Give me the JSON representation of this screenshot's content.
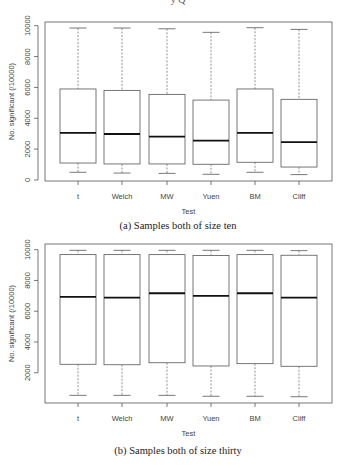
{
  "figure": {
    "top_cut_text": "y Q"
  },
  "chart_data": [
    {
      "type": "box",
      "title": "",
      "caption": "(a) Samples both of size ten",
      "xlabel": "Test",
      "ylabel": "No. significant (/10000)",
      "ylim": [
        0,
        10000
      ],
      "yticks": [
        0,
        2000,
        4000,
        6000,
        8000,
        10000
      ],
      "grid": false,
      "categories": [
        "t",
        "Welch",
        "MW",
        "Yuen",
        "BM",
        "Cliff"
      ],
      "series": [
        {
          "name": "t",
          "whisker_low": 500,
          "q1": 1100,
          "median": 3050,
          "q3": 5900,
          "whisker_high": 9850
        },
        {
          "name": "Welch",
          "whisker_low": 450,
          "q1": 1040,
          "median": 2980,
          "q3": 5810,
          "whisker_high": 9850
        },
        {
          "name": "MW",
          "whisker_low": 430,
          "q1": 1040,
          "median": 2810,
          "q3": 5550,
          "whisker_high": 9800
        },
        {
          "name": "Yuen",
          "whisker_low": 370,
          "q1": 1020,
          "median": 2550,
          "q3": 5180,
          "whisker_high": 9570
        },
        {
          "name": "BM",
          "whisker_low": 500,
          "q1": 1150,
          "median": 3050,
          "q3": 5900,
          "whisker_high": 9870
        },
        {
          "name": "Cliff",
          "whisker_low": 350,
          "q1": 840,
          "median": 2460,
          "q3": 5230,
          "whisker_high": 9760
        }
      ]
    },
    {
      "type": "box",
      "title": "",
      "caption": "(b) Samples both of size thirty",
      "xlabel": "Test",
      "ylabel": "No. significant (/10000)",
      "ylim": [
        0,
        10000
      ],
      "yticks": [
        2000,
        4000,
        6000,
        8000,
        10000
      ],
      "grid": false,
      "categories": [
        "t",
        "Welch",
        "MW",
        "Yuen",
        "BM",
        "Cliff"
      ],
      "series": [
        {
          "name": "t",
          "whisker_low": 530,
          "q1": 2550,
          "median": 6930,
          "q3": 9680,
          "whisker_high": 9960
        },
        {
          "name": "Welch",
          "whisker_low": 530,
          "q1": 2520,
          "median": 6890,
          "q3": 9680,
          "whisker_high": 9960
        },
        {
          "name": "MW",
          "whisker_low": 530,
          "q1": 2650,
          "median": 7170,
          "q3": 9680,
          "whisker_high": 9960
        },
        {
          "name": "Yuen",
          "whisker_low": 470,
          "q1": 2440,
          "median": 7000,
          "q3": 9620,
          "whisker_high": 9960
        },
        {
          "name": "BM",
          "whisker_low": 470,
          "q1": 2590,
          "median": 7170,
          "q3": 9680,
          "whisker_high": 9960
        },
        {
          "name": "Cliff",
          "whisker_low": 440,
          "q1": 2420,
          "median": 6890,
          "q3": 9640,
          "whisker_high": 9940
        }
      ]
    }
  ],
  "colors": {
    "frame": "#555555",
    "box": "#555555",
    "median": "#111111",
    "whisker": "#777777",
    "text": "#444444"
  }
}
